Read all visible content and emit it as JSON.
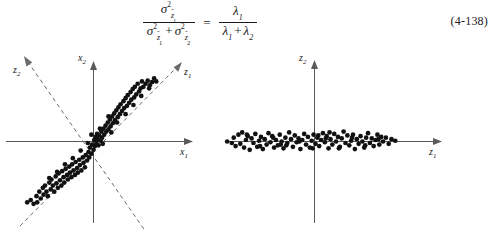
{
  "equation": {
    "number": "(4-138)",
    "lhs": {
      "numerator": {
        "symbol": "σ",
        "power": "2",
        "subscript_base": "z",
        "subscript_accent": "^",
        "subscript_index": "1"
      },
      "denominator_terms": [
        {
          "symbol": "σ",
          "power": "2",
          "subscript_base": "z",
          "subscript_accent": "^",
          "subscript_index": "1"
        },
        {
          "symbol": "σ",
          "power": "2",
          "subscript_base": "z",
          "subscript_accent": "^",
          "subscript_index": "2"
        }
      ],
      "denominator_operator": "+"
    },
    "relation": "=",
    "rhs": {
      "numerator": {
        "symbol": "λ",
        "subscript_index": "1"
      },
      "denominator_terms": [
        {
          "symbol": "λ",
          "subscript_index": "1"
        },
        {
          "symbol": "λ",
          "subscript_index": "2"
        }
      ],
      "denominator_operator": "+"
    },
    "plain_text": "σ²_ẑ1 / ( σ²_ẑ1 + σ²_ẑ2 ) = λ1 / ( λ1 + λ2 )"
  },
  "colors": {
    "background": "#ffffff",
    "text": "#1a1a1a",
    "axis": "#5a5a5a",
    "axis_dashed": "#6a6a6a",
    "point": "#111111"
  },
  "chart_data": [
    {
      "id": "left-scatter",
      "type": "scatter",
      "title": "",
      "xlabel": "x1",
      "ylabel": "x2",
      "grid": false,
      "legend": null,
      "axes": {
        "primary": [
          {
            "name": "x1",
            "label": "x₁",
            "direction": "horizontal-right",
            "style": "solid",
            "arrow": true
          },
          {
            "name": "x2",
            "label": "x₂",
            "direction": "vertical-up",
            "style": "solid",
            "arrow": true
          }
        ],
        "rotated": [
          {
            "name": "z1",
            "label": "z₁",
            "direction": "diagonal-up-right",
            "style": "dashed",
            "arrow": true,
            "angle_deg": 40
          },
          {
            "name": "z2",
            "label": "z₂",
            "direction": "diagonal-up-left",
            "style": "dashed",
            "arrow": true,
            "angle_deg": 140
          }
        ]
      },
      "xlim": [
        -1.15,
        1.15
      ],
      "ylim": [
        -1.0,
        1.0
      ],
      "description": "Elongated correlated cloud along the z1 (45-degree) direction",
      "points": [
        [
          -0.93,
          -0.8
        ],
        [
          -0.88,
          -0.77
        ],
        [
          -0.84,
          -0.82
        ],
        [
          -0.8,
          -0.72
        ],
        [
          -0.79,
          -0.8
        ],
        [
          -0.76,
          -0.66
        ],
        [
          -0.74,
          -0.75
        ],
        [
          -0.71,
          -0.61
        ],
        [
          -0.7,
          -0.7
        ],
        [
          -0.68,
          -0.58
        ],
        [
          -0.66,
          -0.66
        ],
        [
          -0.64,
          -0.72
        ],
        [
          -0.62,
          -0.54
        ],
        [
          -0.6,
          -0.63
        ],
        [
          -0.59,
          -0.5
        ],
        [
          -0.57,
          -0.58
        ],
        [
          -0.55,
          -0.66
        ],
        [
          -0.53,
          -0.46
        ],
        [
          -0.52,
          -0.55
        ],
        [
          -0.5,
          -0.61
        ],
        [
          -0.49,
          -0.42
        ],
        [
          -0.47,
          -0.51
        ],
        [
          -0.45,
          -0.58
        ],
        [
          -0.44,
          -0.39
        ],
        [
          -0.42,
          -0.47
        ],
        [
          -0.41,
          -0.54
        ],
        [
          -0.39,
          -0.36
        ],
        [
          -0.37,
          -0.44
        ],
        [
          -0.36,
          -0.5
        ],
        [
          -0.34,
          -0.33
        ],
        [
          -0.33,
          -0.41
        ],
        [
          -0.31,
          -0.47
        ],
        [
          -0.3,
          -0.3
        ],
        [
          -0.28,
          -0.38
        ],
        [
          -0.26,
          -0.44
        ],
        [
          -0.25,
          -0.27
        ],
        [
          -0.23,
          -0.35
        ],
        [
          -0.22,
          -0.41
        ],
        [
          -0.2,
          -0.24
        ],
        [
          -0.19,
          -0.31
        ],
        [
          -0.17,
          -0.38
        ],
        [
          -0.15,
          -0.21
        ],
        [
          -0.14,
          -0.28
        ],
        [
          -0.12,
          -0.34
        ],
        [
          -0.11,
          -0.18
        ],
        [
          -0.09,
          -0.25
        ],
        [
          -0.07,
          -0.14
        ],
        [
          -0.06,
          -0.21
        ],
        [
          -0.05,
          -0.08
        ],
        [
          -0.03,
          -0.16
        ],
        [
          -0.02,
          -0.04
        ],
        [
          0.0,
          -0.11
        ],
        [
          0.01,
          0.02
        ],
        [
          0.02,
          -0.06
        ],
        [
          0.03,
          0.06
        ],
        [
          0.04,
          -0.02
        ],
        [
          0.05,
          0.1
        ],
        [
          0.06,
          0.03
        ],
        [
          0.07,
          -0.05
        ],
        [
          0.08,
          0.08
        ],
        [
          0.1,
          0.01
        ],
        [
          0.11,
          0.13
        ],
        [
          0.12,
          0.05
        ],
        [
          0.14,
          0.17
        ],
        [
          0.15,
          0.09
        ],
        [
          0.17,
          0.21
        ],
        [
          0.18,
          0.13
        ],
        [
          0.2,
          0.25
        ],
        [
          0.21,
          0.16
        ],
        [
          0.23,
          0.29
        ],
        [
          0.24,
          0.2
        ],
        [
          0.26,
          0.33
        ],
        [
          0.27,
          0.24
        ],
        [
          0.29,
          0.37
        ],
        [
          0.3,
          0.28
        ],
        [
          0.32,
          0.41
        ],
        [
          0.34,
          0.32
        ],
        [
          0.35,
          0.45
        ],
        [
          0.37,
          0.36
        ],
        [
          0.38,
          0.49
        ],
        [
          0.4,
          0.4
        ],
        [
          0.42,
          0.53
        ],
        [
          0.43,
          0.44
        ],
        [
          0.45,
          0.57
        ],
        [
          0.47,
          0.47
        ],
        [
          0.48,
          0.61
        ],
        [
          0.5,
          0.51
        ],
        [
          0.52,
          0.65
        ],
        [
          0.53,
          0.55
        ],
        [
          0.55,
          0.69
        ],
        [
          0.57,
          0.58
        ],
        [
          0.58,
          0.72
        ],
        [
          0.6,
          0.62
        ],
        [
          0.62,
          0.76
        ],
        [
          0.64,
          0.66
        ],
        [
          0.66,
          0.7
        ],
        [
          0.68,
          0.79
        ],
        [
          0.7,
          0.72
        ],
        [
          0.73,
          0.76
        ],
        [
          0.76,
          0.8
        ],
        [
          0.79,
          0.74
        ],
        [
          0.82,
          0.78
        ],
        [
          0.85,
          0.83
        ],
        [
          0.88,
          0.79
        ],
        [
          0.45,
          0.36
        ],
        [
          0.33,
          0.25
        ],
        [
          0.21,
          0.33
        ],
        [
          0.09,
          0.17
        ],
        [
          -0.08,
          -0.02
        ],
        [
          -0.18,
          -0.12
        ],
        [
          -0.29,
          -0.22
        ],
        [
          -0.4,
          -0.3
        ],
        [
          -0.51,
          -0.4
        ],
        [
          -0.62,
          -0.48
        ],
        [
          0.56,
          0.48
        ],
        [
          0.67,
          0.6
        ],
        [
          0.78,
          0.7
        ],
        [
          0.25,
          0.12
        ],
        [
          0.13,
          -0.03
        ],
        [
          -0.03,
          0.09
        ]
      ]
    },
    {
      "id": "right-scatter",
      "type": "scatter",
      "title": "",
      "xlabel": "z1",
      "ylabel": "z2",
      "grid": false,
      "legend": null,
      "axes": {
        "primary": [
          {
            "name": "z1",
            "label": "z₁",
            "direction": "horizontal-right",
            "style": "solid",
            "arrow": true
          },
          {
            "name": "z2",
            "label": "z₂",
            "direction": "vertical-up",
            "style": "solid",
            "arrow": true
          }
        ],
        "rotated": []
      },
      "xlim": [
        -1.15,
        1.15
      ],
      "ylim": [
        -1.0,
        1.0
      ],
      "description": "Same cloud after KL rotation: wide spread along z1, very small variance along z2",
      "points": [
        [
          -0.93,
          0.0
        ],
        [
          -0.86,
          0.05
        ],
        [
          -0.84,
          -0.06
        ],
        [
          -0.81,
          0.09
        ],
        [
          -0.79,
          -0.03
        ],
        [
          -0.77,
          0.12
        ],
        [
          -0.75,
          -0.08
        ],
        [
          -0.73,
          0.02
        ],
        [
          -0.71,
          0.07
        ],
        [
          -0.69,
          -0.11
        ],
        [
          -0.67,
          0.04
        ],
        [
          -0.65,
          -0.02
        ],
        [
          -0.63,
          0.1
        ],
        [
          -0.61,
          -0.07
        ],
        [
          -0.59,
          0.01
        ],
        [
          -0.57,
          0.06
        ],
        [
          -0.55,
          -0.1
        ],
        [
          -0.53,
          0.03
        ],
        [
          -0.51,
          -0.04
        ],
        [
          -0.49,
          0.11
        ],
        [
          -0.47,
          -0.01
        ],
        [
          -0.45,
          0.07
        ],
        [
          -0.43,
          -0.08
        ],
        [
          -0.41,
          0.02
        ],
        [
          -0.39,
          -0.05
        ],
        [
          -0.37,
          0.09
        ],
        [
          -0.35,
          0.0
        ],
        [
          -0.33,
          -0.09
        ],
        [
          -0.31,
          0.05
        ],
        [
          -0.29,
          -0.02
        ],
        [
          -0.27,
          0.12
        ],
        [
          -0.25,
          0.03
        ],
        [
          -0.23,
          -0.07
        ],
        [
          -0.21,
          0.08
        ],
        [
          -0.19,
          -0.01
        ],
        [
          -0.17,
          0.04
        ],
        [
          -0.15,
          -0.1
        ],
        [
          -0.13,
          0.02
        ],
        [
          -0.11,
          0.1
        ],
        [
          -0.09,
          -0.04
        ],
        [
          -0.07,
          0.06
        ],
        [
          -0.05,
          -0.08
        ],
        [
          -0.03,
          0.01
        ],
        [
          -0.01,
          0.09
        ],
        [
          0.01,
          -0.03
        ],
        [
          0.03,
          0.05
        ],
        [
          0.05,
          -0.06
        ],
        [
          0.07,
          0.02
        ],
        [
          0.09,
          0.11
        ],
        [
          0.11,
          -0.01
        ],
        [
          0.13,
          0.07
        ],
        [
          0.15,
          -0.09
        ],
        [
          0.17,
          0.03
        ],
        [
          0.19,
          -0.04
        ],
        [
          0.21,
          0.1
        ],
        [
          0.23,
          0.0
        ],
        [
          0.25,
          0.06
        ],
        [
          0.27,
          -0.07
        ],
        [
          0.29,
          0.04
        ],
        [
          0.31,
          0.13
        ],
        [
          0.33,
          -0.02
        ],
        [
          0.35,
          0.08
        ],
        [
          0.37,
          -0.05
        ],
        [
          0.39,
          0.01
        ],
        [
          0.41,
          0.09
        ],
        [
          0.43,
          -0.1
        ],
        [
          0.45,
          0.03
        ],
        [
          0.47,
          -0.03
        ],
        [
          0.49,
          0.07
        ],
        [
          0.51,
          0.0
        ],
        [
          0.53,
          -0.08
        ],
        [
          0.55,
          0.05
        ],
        [
          0.57,
          0.11
        ],
        [
          0.59,
          -0.02
        ],
        [
          0.61,
          0.04
        ],
        [
          0.63,
          -0.06
        ],
        [
          0.65,
          0.02
        ],
        [
          0.67,
          0.09
        ],
        [
          0.69,
          -0.04
        ],
        [
          0.71,
          0.06
        ],
        [
          0.73,
          0.0
        ],
        [
          0.76,
          0.05
        ],
        [
          0.79,
          -0.03
        ],
        [
          0.82,
          0.03
        ],
        [
          0.86,
          0.01
        ],
        [
          -0.88,
          -0.02
        ],
        [
          -0.72,
          0.09
        ],
        [
          -0.58,
          -0.06
        ],
        [
          -0.44,
          0.05
        ],
        [
          -0.3,
          -0.05
        ],
        [
          -0.16,
          0.0
        ],
        [
          -0.02,
          -0.09
        ],
        [
          0.12,
          0.04
        ],
        [
          0.26,
          -0.09
        ],
        [
          0.4,
          0.05
        ],
        [
          0.54,
          -0.05
        ],
        [
          0.68,
          0.03
        ],
        [
          0.16,
          0.12
        ],
        [
          -0.36,
          -0.04
        ],
        [
          0.04,
          0.08
        ]
      ]
    }
  ]
}
